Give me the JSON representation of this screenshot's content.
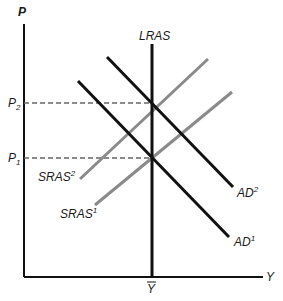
{
  "diagram": {
    "type": "AD-AS model",
    "axes": {
      "y_label": "P",
      "x_label": "Y",
      "x_tick_label": "Y",
      "x_tick_overbar": true,
      "y_ticks": [
        {
          "base": "P",
          "sub": "2"
        },
        {
          "base": "P",
          "sub": "1"
        }
      ]
    },
    "curves": {
      "lras": {
        "label": "LRAS",
        "color": "#111111"
      },
      "ad2": {
        "base": "AD",
        "sup": "2",
        "color": "#111111"
      },
      "ad1": {
        "base": "AD",
        "sup": "1",
        "color": "#111111"
      },
      "sras2": {
        "base": "SRAS",
        "sup": "2",
        "color": "#8a8a8a"
      },
      "sras1": {
        "base": "SRAS",
        "sup": "1",
        "color": "#8a8a8a"
      }
    },
    "guides": {
      "dashed_color": "#666666"
    }
  }
}
